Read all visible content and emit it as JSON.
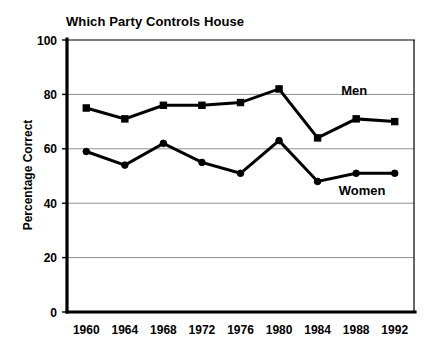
{
  "chart_data": {
    "type": "line",
    "title": "Which Party Controls House",
    "xlabel": "",
    "ylabel": "Percentage Correct",
    "categories": [
      "1960",
      "1964",
      "1968",
      "1972",
      "1976",
      "1980",
      "1984",
      "1988",
      "1992"
    ],
    "series": [
      {
        "name": "Men",
        "marker": "square",
        "values": [
          75,
          71,
          76,
          76,
          77,
          82,
          64,
          71,
          70
        ]
      },
      {
        "name": "Women",
        "marker": "circle",
        "values": [
          59,
          54,
          62,
          55,
          51,
          63,
          48,
          51,
          51
        ]
      }
    ],
    "ylim": [
      0,
      100
    ],
    "yticks": [
      "0",
      "20",
      "40",
      "60",
      "80",
      "100"
    ],
    "ytick_values": [
      0,
      20,
      40,
      60,
      80,
      100
    ],
    "grid": "horizontal",
    "legend_position": "inline-annotations",
    "annotations": [
      {
        "label": "Men",
        "series": "Men"
      },
      {
        "label": "Women",
        "series": "Women"
      }
    ],
    "colors": {
      "line": "#000000",
      "grid": "#8f8f8f",
      "axis": "#000000",
      "background": "#ffffff"
    }
  }
}
